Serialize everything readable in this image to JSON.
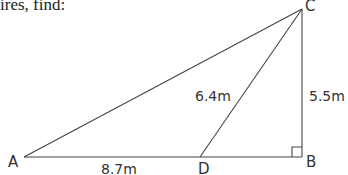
{
  "header": {
    "text": "ires, find:"
  },
  "diagram": {
    "type": "right-triangle",
    "vertices": {
      "A": {
        "label": "A"
      },
      "B": {
        "label": "B"
      },
      "C": {
        "label": "C"
      },
      "D": {
        "label": "D"
      }
    },
    "measurements": {
      "AD": "8.7m",
      "DC": "6.4m",
      "BC": "5.5m"
    },
    "right_angle_at": "B",
    "line_color": "#444444"
  }
}
